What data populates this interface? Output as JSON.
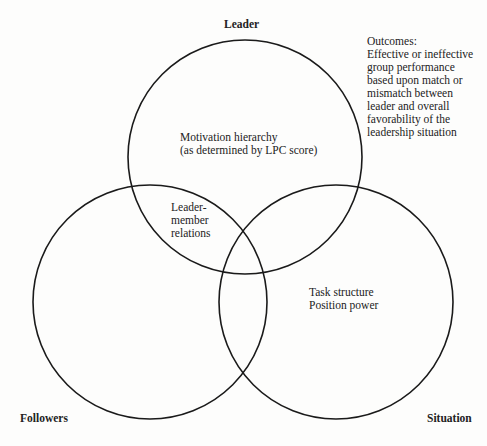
{
  "diagram": {
    "type": "venn",
    "stroke_color": "#1a1a1a",
    "circles": [
      {
        "name": "Leader",
        "cx": 245,
        "cy": 157,
        "r": 117
      },
      {
        "name": "Followers",
        "cx": 150,
        "cy": 302,
        "r": 117
      },
      {
        "name": "Situation",
        "cx": 336,
        "cy": 302,
        "r": 117
      }
    ],
    "labels": {
      "leader": "Leader",
      "followers": "Followers",
      "situation": "Situation"
    },
    "regions": {
      "leader_only": {
        "lines": [
          "Motivation hierarchy",
          "(as determined by LPC score)"
        ]
      },
      "leader_followers": {
        "lines": [
          "Leader-",
          "member",
          "relations"
        ]
      },
      "situation_only": {
        "lines": [
          "Task structure",
          "Position power"
        ]
      }
    },
    "outcomes": {
      "lines": [
        "Outcomes:",
        "Effective or ineffective",
        "group performance",
        "based upon match or",
        "mismatch between",
        "leader and overall",
        "favorability of the",
        "leadership situation"
      ]
    }
  }
}
